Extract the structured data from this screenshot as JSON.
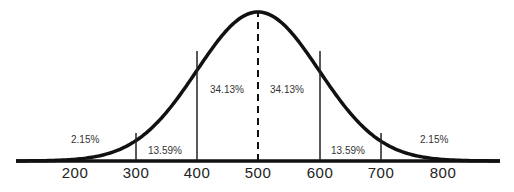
{
  "chart_data": {
    "type": "area",
    "title": "",
    "xlabel": "",
    "ylabel": "",
    "mean": 500,
    "sd": 100,
    "x_ticks": [
      "200",
      "300",
      "400",
      "500",
      "600",
      "700",
      "800"
    ],
    "xlim": [
      180,
      860
    ],
    "grid": false,
    "legend": null,
    "regions": [
      {
        "from": 200,
        "to": 300,
        "label": "2.15%",
        "value": 2.15
      },
      {
        "from": 300,
        "to": 400,
        "label": "13.59%",
        "value": 13.59
      },
      {
        "from": 400,
        "to": 500,
        "label": "34.13%",
        "value": 34.13
      },
      {
        "from": 500,
        "to": 600,
        "label": "34.13%",
        "value": 34.13
      },
      {
        "from": 600,
        "to": 700,
        "label": "13.59%",
        "value": 13.59
      },
      {
        "from": 700,
        "to": 800,
        "label": "2.15%",
        "value": 2.15
      }
    ],
    "vertical_lines": [
      300,
      400,
      500,
      600,
      700
    ],
    "mean_line_style": "dashed"
  },
  "labels": {
    "pct_left_tail": "2.15%",
    "pct_left_mid": "13.59%",
    "pct_left_center": "34.13%",
    "pct_right_center": "34.13%",
    "pct_right_mid": "13.59%",
    "pct_right_tail": "2.15%",
    "tick_200": "200",
    "tick_300": "300",
    "tick_400": "400",
    "tick_500": "500",
    "tick_600": "600",
    "tick_700": "700",
    "tick_800": "800"
  },
  "colors": {
    "curve": "#111111",
    "text": "#333333",
    "background": "#ffffff"
  }
}
